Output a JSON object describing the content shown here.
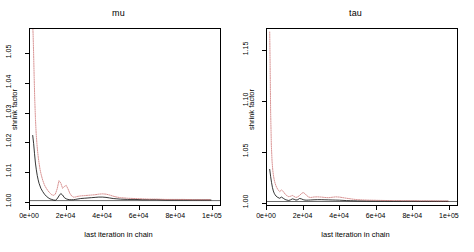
{
  "figure": {
    "device": "R base graphics",
    "background": "#ffffff",
    "layout": "1 row x 2 columns"
  },
  "chart_data": [
    {
      "type": "line",
      "title": "mu",
      "xlabel": "last iteration in chain",
      "ylabel": "shrink factor",
      "xlim": [
        0,
        105000
      ],
      "ylim": [
        0.9985,
        1.0585
      ],
      "xticks": [
        0,
        20000,
        40000,
        60000,
        80000,
        100000
      ],
      "xticklabels": [
        "0e+00",
        "2e+04",
        "4e+04",
        "6e+04",
        "8e+04",
        "1e+05"
      ],
      "yticks": [
        1.0,
        1.01,
        1.02,
        1.03,
        1.04,
        1.05
      ],
      "yticklabels": [
        "1.00",
        "1.01",
        "1.02",
        "1.03",
        "1.04",
        "1.05"
      ],
      "grid": false,
      "legend": null,
      "reference_line": {
        "y": 1.0,
        "style": "solid",
        "color": "#000000"
      },
      "series": [
        {
          "name": "median",
          "style": "solid",
          "color": "#000000",
          "x": [
            1500,
            2000,
            2500,
            3000,
            3500,
            4000,
            4500,
            5000,
            6000,
            7000,
            8000,
            9000,
            10000,
            11000,
            12000,
            13000,
            14000,
            15000,
            16000,
            17000,
            18000,
            19000,
            20000,
            21000,
            22000,
            23000,
            24000,
            25000,
            26000,
            28000,
            30000,
            32000,
            34000,
            36000,
            38000,
            40000,
            42000,
            44000,
            46000,
            48000,
            50000,
            54000,
            58000,
            62000,
            66000,
            70000,
            75000,
            80000,
            85000,
            90000,
            95000,
            100000
          ],
          "y": [
            1.0222,
            1.0195,
            1.016,
            1.0128,
            1.0105,
            1.0086,
            1.0071,
            1.0059,
            1.0042,
            1.0031,
            1.0022,
            1.0015,
            1.001,
            1.0006,
            1.0004,
            1.0002,
            1.0001,
            1.0006,
            1.0016,
            1.0024,
            1.0019,
            1.001,
            1.0006,
            1.0004,
            1.0003,
            1.0003,
            1.0003,
            1.0004,
            1.0005,
            1.0007,
            1.0008,
            1.0009,
            1.001,
            1.0011,
            1.0012,
            1.0012,
            1.0011,
            1.0009,
            1.0007,
            1.0006,
            1.0005,
            1.0004,
            1.0004,
            1.0003,
            1.0003,
            1.0003,
            1.0002,
            1.0002,
            1.0002,
            1.0002,
            1.0002,
            1.0002
          ]
        },
        {
          "name": "97.5% quantile",
          "style": "dotted",
          "color": "#c86464",
          "x": [
            1500,
            1700,
            2000,
            2300,
            2600,
            3000,
            3400,
            3800,
            4200,
            4600,
            5000,
            5600,
            6200,
            7000,
            8000,
            9000,
            10000,
            11000,
            12000,
            13000,
            14000,
            15000,
            16000,
            17000,
            18000,
            19000,
            20000,
            21000,
            22000,
            23000,
            24000,
            25000,
            26000,
            28000,
            30000,
            32000,
            34000,
            36000,
            38000,
            40000,
            42000,
            44000,
            46000,
            48000,
            50000,
            54000,
            58000,
            62000,
            66000,
            70000,
            75000,
            80000,
            85000,
            90000,
            95000,
            100000
          ],
          "y": [
            1.06,
            1.057,
            1.05,
            1.042,
            1.035,
            1.028,
            1.023,
            1.0195,
            1.0168,
            1.0146,
            1.0128,
            1.0105,
            1.0088,
            1.007,
            1.0053,
            1.0042,
            1.0033,
            1.0026,
            1.002,
            1.0018,
            1.0022,
            1.004,
            1.0068,
            1.006,
            1.0042,
            1.0048,
            1.0052,
            1.004,
            1.0025,
            1.0016,
            1.0012,
            1.0012,
            1.0014,
            1.0016,
            1.0017,
            1.0018,
            1.0019,
            1.002,
            1.0022,
            1.0023,
            1.0022,
            1.0019,
            1.0015,
            1.0012,
            1.001,
            1.0008,
            1.0007,
            1.0006,
            1.0005,
            1.0005,
            1.0004,
            1.0004,
            1.0004,
            1.0003,
            1.0003,
            1.0003
          ]
        }
      ]
    },
    {
      "type": "line",
      "title": "tau",
      "xlabel": "last iteration in chain",
      "ylabel": "shrink factor",
      "xlim": [
        0,
        105000
      ],
      "ylim": [
        0.9965,
        1.172
      ],
      "xticks": [
        0,
        20000,
        40000,
        60000,
        80000,
        100000
      ],
      "xticklabels": [
        "0e+00",
        "2e+04",
        "4e+04",
        "6e+04",
        "8e+04",
        "1e+05"
      ],
      "yticks": [
        1.0,
        1.05,
        1.1,
        1.15
      ],
      "yticklabels": [
        "1.00",
        "1.05",
        "1.10",
        "1.15"
      ],
      "grid": false,
      "legend": null,
      "reference_line": {
        "y": 1.0,
        "style": "solid",
        "color": "#000000"
      },
      "series": [
        {
          "name": "median",
          "style": "solid",
          "color": "#000000",
          "x": [
            1500,
            2000,
            2500,
            3000,
            3500,
            4000,
            4500,
            5000,
            6000,
            7000,
            8000,
            9000,
            10000,
            11000,
            12000,
            13000,
            14000,
            15000,
            16000,
            17000,
            18000,
            19000,
            20000,
            21000,
            22000,
            23000,
            24000,
            26000,
            28000,
            30000,
            32000,
            34000,
            36000,
            38000,
            40000,
            42000,
            44000,
            46000,
            48000,
            50000,
            55000,
            60000,
            65000,
            70000,
            75000,
            80000,
            85000,
            90000,
            95000,
            100000
          ],
          "y": [
            1.032,
            1.025,
            1.019,
            1.014,
            1.0105,
            1.0082,
            1.0066,
            1.0054,
            1.004,
            1.0032,
            1.0044,
            1.0032,
            1.002,
            1.0014,
            1.001,
            1.0016,
            1.0026,
            1.0022,
            1.0014,
            1.0018,
            1.003,
            1.0026,
            1.0018,
            1.0014,
            1.0013,
            1.0014,
            1.0015,
            1.0017,
            1.0018,
            1.0018,
            1.0017,
            1.0016,
            1.0015,
            1.0014,
            1.0013,
            1.0011,
            1.0009,
            1.0008,
            1.0007,
            1.0006,
            1.0005,
            1.0004,
            1.0004,
            1.0003,
            1.0003,
            1.0003,
            1.0002,
            1.0002,
            1.0002,
            1.0002
          ]
        },
        {
          "name": "97.5% quantile",
          "style": "dotted",
          "color": "#c86464",
          "x": [
            1500,
            1700,
            2000,
            2400,
            2800,
            3200,
            3600,
            4000,
            4500,
            5000,
            5500,
            6000,
            6500,
            7000,
            8000,
            9000,
            10000,
            11000,
            12000,
            13000,
            14000,
            15000,
            16000,
            17000,
            18000,
            19000,
            20000,
            21000,
            22000,
            23000,
            24000,
            25000,
            26000,
            28000,
            30000,
            32000,
            34000,
            36000,
            38000,
            40000,
            42000,
            44000,
            46000,
            48000,
            50000,
            55000,
            60000,
            65000,
            70000,
            75000,
            80000,
            85000,
            90000,
            95000,
            100000
          ],
          "y": [
            1.169,
            1.14,
            1.09,
            1.056,
            1.04,
            1.031,
            1.0255,
            1.0215,
            1.018,
            1.0155,
            1.0135,
            1.012,
            1.0108,
            1.0098,
            1.0115,
            1.01,
            1.0074,
            1.0058,
            1.0048,
            1.0052,
            1.006,
            1.005,
            1.004,
            1.0046,
            1.006,
            1.0078,
            1.009,
            1.0078,
            1.0058,
            1.0045,
            1.004,
            1.0042,
            1.0045,
            1.0046,
            1.0044,
            1.004,
            1.0038,
            1.0042,
            1.0046,
            1.0044,
            1.0038,
            1.0032,
            1.0027,
            1.0022,
            1.0018,
            1.0014,
            1.0012,
            1.001,
            1.0009,
            1.0008,
            1.0007,
            1.0006,
            1.0006,
            1.0005,
            1.0005
          ]
        }
      ]
    }
  ]
}
